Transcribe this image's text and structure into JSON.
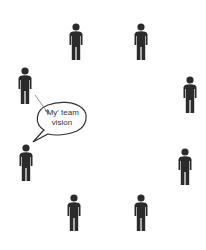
{
  "diagram": {
    "bubble_text_line1": "'My' team",
    "bubble_text_line2": "vision",
    "figure_color": "#2b2b2b",
    "line_color": "#555555",
    "people": [
      {
        "id": "top-left",
        "x": 68,
        "y": 23
      },
      {
        "id": "top-right",
        "x": 133,
        "y": 23
      },
      {
        "id": "left-upper",
        "x": 17,
        "y": 67
      },
      {
        "id": "right-upper",
        "x": 182,
        "y": 76
      },
      {
        "id": "left-lower",
        "x": 18,
        "y": 144
      },
      {
        "id": "right-lower",
        "x": 177,
        "y": 148
      },
      {
        "id": "bottom-left",
        "x": 66,
        "y": 194
      },
      {
        "id": "bottom-right",
        "x": 133,
        "y": 194
      }
    ]
  }
}
